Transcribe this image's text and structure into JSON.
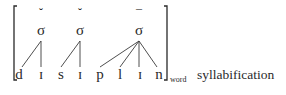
{
  "diagram": {
    "type": "syllable-structure-tree",
    "caption": "syllabification",
    "bracket_subscript": "word",
    "syllable_node_label": "σ",
    "weights": [
      {
        "symbol": "˘",
        "name": "light"
      },
      {
        "symbol": "˘",
        "name": "light"
      },
      {
        "symbol": "¯",
        "name": "heavy"
      }
    ],
    "syllables": [
      {
        "label": "σ",
        "segments": [
          "d",
          "ɪ"
        ]
      },
      {
        "label": "σ",
        "segments": [
          "s",
          "ɪ"
        ]
      },
      {
        "label": "σ",
        "segments": [
          "p",
          "l",
          "ɪ",
          "n"
        ]
      }
    ],
    "segments": [
      "d",
      "ɪ",
      "s",
      "ɪ",
      "p",
      "l",
      "ɪ",
      "n"
    ],
    "colors": {
      "ink": "#2a2a2a",
      "background": "#ffffff"
    }
  }
}
